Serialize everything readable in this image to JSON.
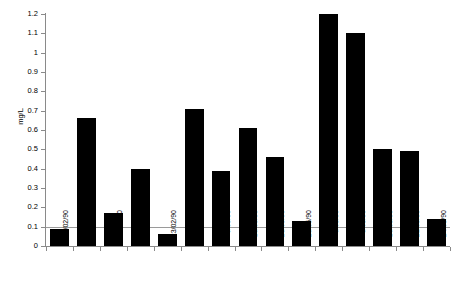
{
  "chart_data": {
    "type": "bar",
    "title": "",
    "subtitle": "",
    "xlabel": "",
    "ylabel": "mg/L",
    "ylim": [
      0,
      1.2
    ],
    "ytick_labels": [
      "1.2",
      "1.1",
      "1",
      "0.9",
      "0.8",
      "0.7",
      "0.6",
      "0.5",
      "0.4",
      "0.3",
      "0.2",
      "0.1",
      "0"
    ],
    "ytick_values": [
      1.2,
      1.1,
      1.0,
      0.9,
      0.8,
      0.7,
      0.6,
      0.5,
      0.4,
      0.3,
      0.2,
      0.1,
      0
    ],
    "grid": false,
    "legend": null,
    "bar_color": "#000000",
    "axis_color": "#8a8a8a",
    "reference_line": {
      "value": 0.1,
      "color": "#9a9a9a",
      "label": ""
    },
    "categories": [
      "11/02/90",
      "13/02/90",
      "19/02/90",
      "21/02/90",
      "23/02/90",
      "7/05/90",
      "9/05/90",
      "15/05/90",
      "23/05/90",
      "25/05/90",
      "6/08/90",
      "8/08/90",
      "16/08/90",
      "21/08/90",
      "24/08/90"
    ],
    "values": [
      0.09,
      0.66,
      0.17,
      0.4,
      0.06,
      0.71,
      0.39,
      0.61,
      0.46,
      0.13,
      1.2,
      1.1,
      0.5,
      0.49,
      0.14
    ]
  }
}
